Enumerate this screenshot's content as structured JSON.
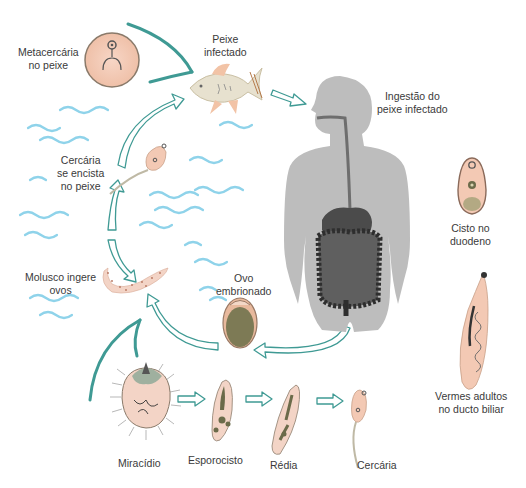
{
  "diagram": {
    "colors": {
      "arrow_teal": "#3f9a94",
      "water_blue": "#8fd3ea",
      "body_gray": "#bdbdbd",
      "organ_dark": "#3c3c3c",
      "larva_pink": "#f3c9b4",
      "larva_olive": "#7d7a55",
      "text": "#3a3a3a"
    },
    "labels": {
      "metacercaria": {
        "line1": "Metacercária",
        "line2": "no peixe"
      },
      "peixe": {
        "line1": "Peixe",
        "line2": "infectado"
      },
      "ingestao": {
        "line1": "Ingestão do",
        "line2": "peixe infectado"
      },
      "cercaria_encista": {
        "line1": "Cercária",
        "line2": "se encista",
        "line3": "no peixe"
      },
      "cisto": {
        "line1": "Cisto no",
        "line2": "duodeno"
      },
      "molusco": {
        "line1": "Molusco ingere",
        "line2": "ovos"
      },
      "ovo": {
        "line1": "Ovo",
        "line2": "embrionado"
      },
      "vermes": {
        "line1": "Vermes adultos",
        "line2": "no ducto biliar"
      },
      "miracidio": "Miracídio",
      "esporocisto": "Esporocisto",
      "redia": "Rédia",
      "cercaria": "Cercária"
    },
    "stages": [
      "Ovo embrionado",
      "Miracídio",
      "Esporocisto",
      "Rédia",
      "Cercária",
      "Cercária se encista no peixe",
      "Metacercária no peixe",
      "Peixe infectado",
      "Ingestão do peixe infectado",
      "Cisto no duodeno",
      "Vermes adultos no ducto biliar"
    ]
  }
}
